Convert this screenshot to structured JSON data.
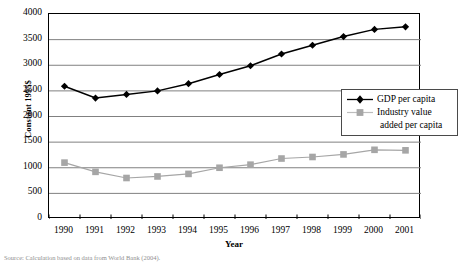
{
  "chart_data": {
    "type": "line",
    "title": "",
    "xlabel": "Year",
    "ylabel": "Constant 1995$",
    "categories": [
      "1990",
      "1991",
      "1992",
      "1993",
      "1994",
      "1995",
      "1996",
      "1997",
      "1998",
      "1999",
      "2000",
      "2001"
    ],
    "x": [
      1990,
      1991,
      1992,
      1993,
      1994,
      1995,
      1996,
      1997,
      1998,
      1999,
      2000,
      2001
    ],
    "xlim": [
      1990,
      2001
    ],
    "ylim": [
      0,
      4000
    ],
    "yticks": [
      0,
      500,
      1000,
      1500,
      2000,
      2500,
      3000,
      3500,
      4000
    ],
    "ytick_labels": [
      "0",
      "500",
      "1000",
      "1500",
      "2000",
      "2500",
      "3000",
      "3500",
      "4000"
    ],
    "grid": true,
    "grid_axis": "y",
    "legend_position": "inside-upper-right",
    "series": [
      {
        "name": "GDP per capita",
        "color": "#000000",
        "marker": "diamond",
        "values": [
          2590,
          2360,
          2430,
          2500,
          2640,
          2820,
          2990,
          3220,
          3390,
          3560,
          3700,
          3750
        ]
      },
      {
        "name": "Industry value added per capita",
        "color": "#a6a6a6",
        "marker": "square",
        "values": [
          1100,
          920,
          800,
          830,
          880,
          1000,
          1060,
          1180,
          1210,
          1260,
          1350,
          1340
        ]
      }
    ]
  },
  "legend": {
    "items": [
      {
        "label": "GDP per capita",
        "label2": ""
      },
      {
        "label": "Industry value",
        "label2": "added per capita"
      }
    ]
  },
  "source": {
    "text": "Source: Calculation based on data from World Bank (2004)."
  },
  "colors": {
    "gdp": "#000000",
    "industry": "#a6a6a6",
    "grid": "#808080",
    "axis": "#000000"
  }
}
